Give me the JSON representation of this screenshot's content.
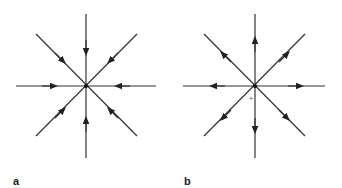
{
  "figure": {
    "line_color": "#333333",
    "arrow_color": "#222222",
    "panels": [
      {
        "label": "a",
        "description": "Sink: eight radial field lines with arrows pointing inward toward the center",
        "direction": "inward",
        "center": [
          86,
          86
        ],
        "show_plus": false
      },
      {
        "label": "b",
        "description": "Source: eight radial field lines with arrows pointing outward from the center",
        "direction": "outward",
        "center": [
          255,
          86
        ],
        "show_plus": true,
        "plus_symbol": "+"
      }
    ]
  }
}
